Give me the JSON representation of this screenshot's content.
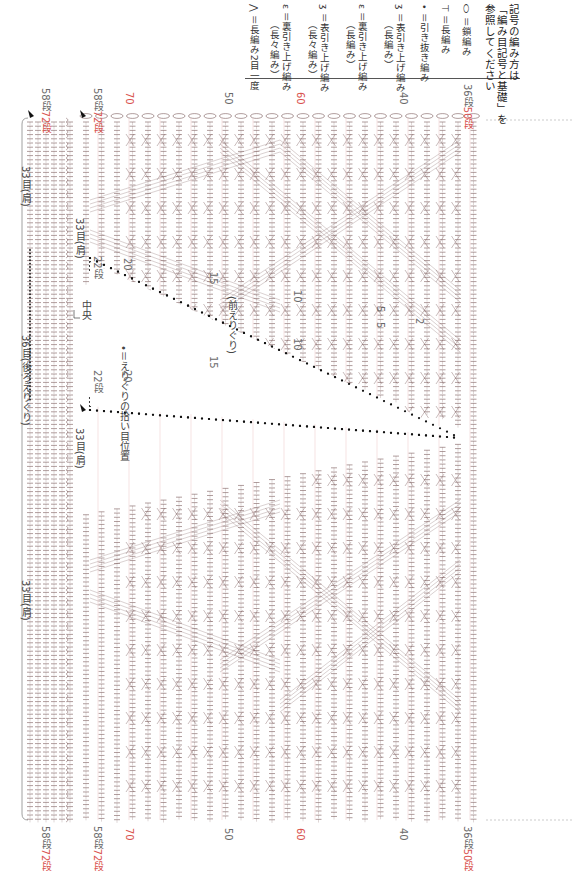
{
  "legend": {
    "note_line1": "記号の編み方は",
    "note_line2": "「編み目記号と基礎」を",
    "note_line3": "参照してください",
    "items": [
      {
        "symbol": "chain-stitch",
        "label": "＝鎖編み",
        "sub": ""
      },
      {
        "symbol": "double-crochet",
        "label": "＝長編み",
        "sub": ""
      },
      {
        "symbol": "slip-stitch",
        "label": "＝引き抜き編み",
        "sub": ""
      },
      {
        "symbol": "front-post-dc",
        "label": "＝表引き上げ編み",
        "sub": "（長編み）"
      },
      {
        "symbol": "back-post-dc",
        "label": "＝裏引き上げ編み",
        "sub": "（長編み）"
      },
      {
        "symbol": "front-post-tr",
        "label": "＝表引き上げ編み",
        "sub": "（長々編み）"
      },
      {
        "symbol": "back-post-tr",
        "label": "＝裏引き上げ編み",
        "sub": "（長々編み）"
      },
      {
        "symbol": "dc2tog",
        "label": "＝長編み2目一度",
        "sub": ""
      }
    ]
  },
  "back_panel": {
    "label_left_shoulder": "33目(肩)",
    "label_center": "36目(後ろえりぐり)",
    "label_right_shoulder": "33目(肩)",
    "center_mark": "中央",
    "row_top_gray": "58段",
    "row_top_red": "72段"
  },
  "front_panel": {
    "shoulder_left": "33目(肩)",
    "shoulder_right": "33目(肩)",
    "neckline": "(前えりぐり)",
    "pickup_note": "•＝えりぐりの拾い目位置",
    "neck_rows_left": [
      "22段",
      "20",
      "15",
      "10",
      "5"
    ],
    "neck_rows_right": [
      "22段",
      "20",
      "15",
      "10",
      "5",
      "2"
    ]
  },
  "row_labels": {
    "top": [
      {
        "text_gray": "58段",
        "text_red": "72段"
      },
      {
        "text_gray": "58段",
        "text_red": "72段"
      },
      {
        "text_red": "70"
      },
      {
        "text_gray": "50"
      },
      {
        "text_red": "60"
      },
      {
        "text_gray": "40"
      },
      {
        "text_gray": "36段",
        "text_red": "50段"
      }
    ],
    "bottom": [
      {
        "text_gray": "58段",
        "text_red": "72段"
      },
      {
        "text_gray": "58段",
        "text_red": "72段"
      },
      {
        "text_red": "70"
      },
      {
        "text_gray": "50"
      },
      {
        "text_red": "60"
      },
      {
        "text_gray": "40"
      },
      {
        "text_gray": "36段",
        "text_red": "50段"
      }
    ]
  },
  "colors": {
    "stitch": "#7a5a5a",
    "grid_pink": "#f0c8c8",
    "label_red": "#d9534f",
    "label_gray": "#6a6a6a"
  }
}
